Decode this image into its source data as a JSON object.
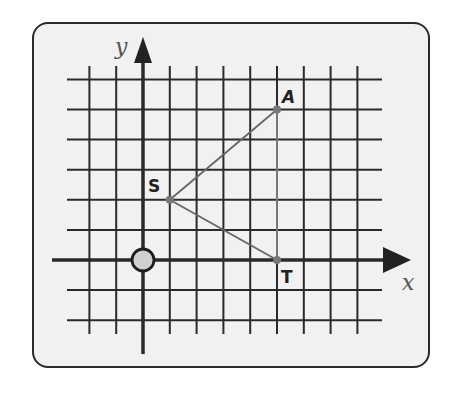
{
  "figure": {
    "axes": {
      "x_label": "x",
      "y_label": "y"
    },
    "grid": {
      "x_lines": [
        -2,
        -1,
        0,
        1,
        2,
        3,
        4,
        5,
        6,
        7,
        8
      ],
      "y_lines": [
        6,
        5,
        4,
        3,
        2,
        1,
        0,
        -1,
        -2
      ]
    },
    "origin_marker": "circle",
    "points": [
      {
        "label": "S",
        "x": 1,
        "y": 2
      },
      {
        "label": "A",
        "x": 5,
        "y": 5
      },
      {
        "label": "T",
        "x": 5,
        "y": 0
      }
    ],
    "segments": [
      {
        "from": "S",
        "to": "A"
      },
      {
        "from": "S",
        "to": "T"
      },
      {
        "from": "A",
        "to": "T"
      }
    ],
    "colors": {
      "frame_bg": "#f1f1f1",
      "grid": "#2a2a2a",
      "segment": "#666666",
      "point": "#777777",
      "origin_fill": "#d0d0d0"
    }
  }
}
